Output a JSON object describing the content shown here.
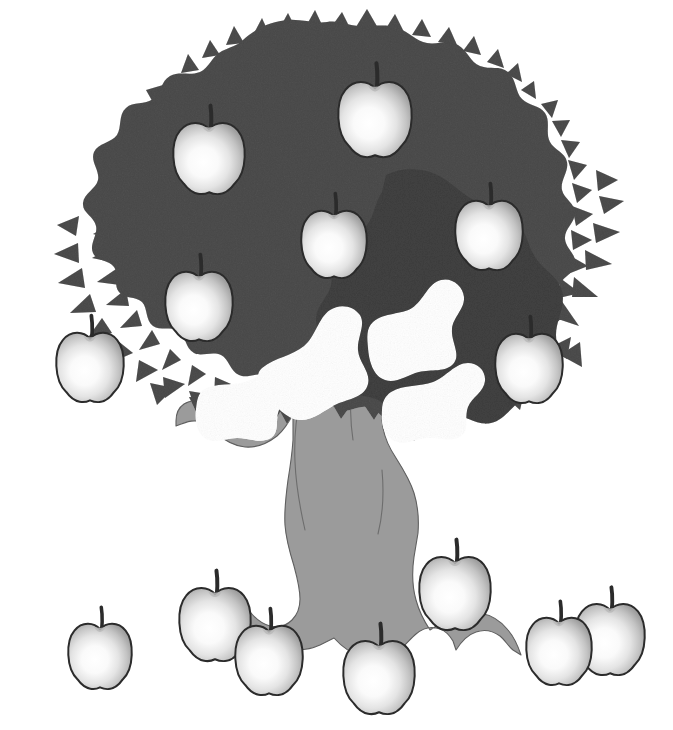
{
  "scene": {
    "title": "Apple tree with apples on tree and on the ground",
    "background_color": "#ffffff",
    "width": 673,
    "height": 730
  },
  "palette": {
    "background": "#ffffff",
    "canopy_fill": "#8a8a8a",
    "canopy_fill_dark": "#808080",
    "trunk_fill": "#9b9b9b",
    "trunk_outline": "#595959",
    "apple_outline": "#2b2b2b",
    "apple_highlight": "#ffffff",
    "apple_mid": "#efefef",
    "apple_shadow": "#9d9d9d",
    "stem_color": "#2b2b2b"
  },
  "tree": {
    "name": "apple-tree",
    "canopy_label": "Tree canopy with leafy scalloped edge",
    "trunk_label": "Tree trunk with branches and roots"
  },
  "counts": {
    "apples_on_tree": 7,
    "apples_on_ground": 7,
    "apples_total": 14
  },
  "apples_on_tree": [
    {
      "id": "tree-apple-1",
      "label": "Apple on tree upper left",
      "cx": 209,
      "cy": 157,
      "rx": 36,
      "ry": 36,
      "stem_h": 22,
      "z": 3
    },
    {
      "id": "tree-apple-2",
      "label": "Apple on tree top",
      "cx": 375,
      "cy": 118,
      "rx": 37,
      "ry": 38,
      "stem_h": 24,
      "z": 3
    },
    {
      "id": "tree-apple-3",
      "label": "Apple on tree center",
      "cx": 334,
      "cy": 243,
      "rx": 33,
      "ry": 34,
      "stem_h": 22,
      "z": 3
    },
    {
      "id": "tree-apple-4",
      "label": "Apple on tree right",
      "cx": 489,
      "cy": 234,
      "rx": 34,
      "ry": 35,
      "stem_h": 22,
      "z": 3
    },
    {
      "id": "tree-apple-5",
      "label": "Apple on tree middle left",
      "cx": 199,
      "cy": 305,
      "rx": 34,
      "ry": 35,
      "stem_h": 22,
      "z": 3
    },
    {
      "id": "tree-apple-6",
      "label": "Apple on tree lower left",
      "cx": 90,
      "cy": 366,
      "rx": 34,
      "ry": 35,
      "stem_h": 22,
      "z": 3
    },
    {
      "id": "tree-apple-7",
      "label": "Apple on tree lower right",
      "cx": 529,
      "cy": 367,
      "rx": 34,
      "ry": 35,
      "stem_h": 22,
      "z": 3
    }
  ],
  "apples_on_ground": [
    {
      "id": "ground-apple-1",
      "label": "Apple on ground far left",
      "cx": 100,
      "cy": 655,
      "rx": 32,
      "ry": 33,
      "stem_h": 21,
      "z": 5
    },
    {
      "id": "ground-apple-2",
      "label": "Apple on ground left pair back",
      "cx": 215,
      "cy": 623,
      "rx": 36,
      "ry": 37,
      "stem_h": 22,
      "z": 5
    },
    {
      "id": "ground-apple-3",
      "label": "Apple on ground left pair front",
      "cx": 269,
      "cy": 659,
      "rx": 34,
      "ry": 35,
      "stem_h": 22,
      "z": 6
    },
    {
      "id": "ground-apple-4",
      "label": "Apple on ground center",
      "cx": 379,
      "cy": 676,
      "rx": 36,
      "ry": 37,
      "stem_h": 22,
      "z": 6
    },
    {
      "id": "ground-apple-5",
      "label": "Apple on ground center right",
      "cx": 455,
      "cy": 592,
      "rx": 36,
      "ry": 37,
      "stem_h": 22,
      "z": 5
    },
    {
      "id": "ground-apple-6",
      "label": "Apple on ground right pair front",
      "cx": 559,
      "cy": 650,
      "rx": 33,
      "ry": 34,
      "stem_h": 21,
      "z": 6
    },
    {
      "id": "ground-apple-7",
      "label": "Apple on ground right pair back",
      "cx": 610,
      "cy": 638,
      "rx": 35,
      "ry": 36,
      "stem_h": 21,
      "z": 5
    }
  ]
}
